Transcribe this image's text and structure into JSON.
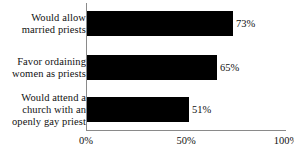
{
  "chart_data": {
    "type": "bar",
    "orientation": "horizontal",
    "title": "",
    "xlabel": "",
    "ylabel": "",
    "xlim": [
      0,
      100
    ],
    "grid": false,
    "legend": false,
    "categories": [
      "Would allow married priests",
      "Favor ordaining women as priests",
      "Would attend a church with an openly gay priest"
    ],
    "category_lines": [
      [
        "Would allow",
        "married priests"
      ],
      [
        "Favor ordaining",
        "women as priests"
      ],
      [
        "Would attend a",
        "church with an",
        "openly gay priest"
      ]
    ],
    "values": [
      73,
      65,
      51
    ],
    "value_labels": [
      "73%",
      "65%",
      "51%"
    ],
    "ticks": [
      0,
      50,
      100
    ],
    "tick_labels": [
      "0%",
      "50%",
      "100%"
    ],
    "bar_color": "#000000",
    "axis_color": "#8a8a8a",
    "background_color": "#ffffff",
    "text_color": "#111111"
  }
}
